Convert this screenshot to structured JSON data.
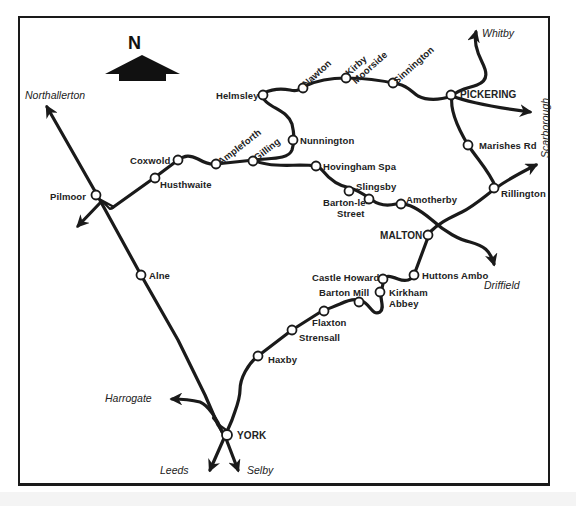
{
  "map": {
    "type": "railway-map",
    "region": "North Yorkshire",
    "compass": {
      "label": "N",
      "icon": "north-arrow-icon"
    },
    "colors": {
      "line": "#1a1a1a",
      "background": "#ffffff",
      "station_fill": "#ffffff"
    },
    "destinations": {
      "northallerton": "Northallerton",
      "whitby": "Whitby",
      "scarborough": "Scarborough",
      "driffield": "Driffield",
      "harrogate": "Harrogate",
      "leeds": "Leeds",
      "selby": "Selby"
    },
    "stations": {
      "pilmoor": "Pilmoor",
      "alne": "Alne",
      "coxwold": "Coxwold",
      "husthwaite": "Husthwaite",
      "ampleforth": "Ampleforth",
      "gilling": "Gilling",
      "nunnington": "Nunnington",
      "helmsley": "Helmsley",
      "nawton": "Nawton",
      "kirby_moorside": "Kirby Moorside",
      "kirby_moorside_line1": "Kirby",
      "kirby_moorside_line2": "Moorside",
      "sinnington": "Sinnington",
      "pickering": "PICKERING",
      "marishes_rd": "Marishes Rd",
      "rillington": "Rillington",
      "hovingham_spa": "Hovingham Spa",
      "slingsby": "Slingsby",
      "barton_le_street_line1": "Barton-le-",
      "barton_le_street_line2": "Street",
      "amotherby": "Amotherby",
      "malton": "MALTON",
      "huttons_ambo": "Huttons Ambo",
      "castle_howard": "Castle Howard",
      "kirkham_abbey_line1": "Kirkham",
      "kirkham_abbey_line2": "Abbey",
      "barton_mill": "Barton Mill",
      "flaxton": "Flaxton",
      "strensall": "Strensall",
      "haxby": "Haxby",
      "york": "YORK"
    }
  }
}
